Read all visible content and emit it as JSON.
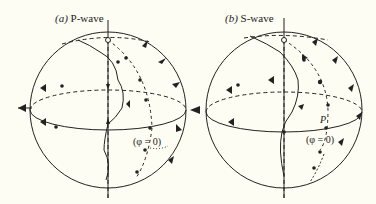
{
  "figure": {
    "panels": [
      {
        "id": "a",
        "label_prefix": "(a)",
        "title": "P-wave",
        "annotation": "(φ = 0)"
      },
      {
        "id": "b",
        "label_prefix": "(b)",
        "title": "S-wave",
        "annotation": "(φ = 0)",
        "point_label": "P"
      }
    ],
    "colors": {
      "background": "#fdfdf3",
      "ink": "#222222"
    }
  }
}
